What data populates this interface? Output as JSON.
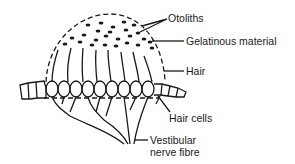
{
  "diagram": {
    "labels": {
      "otoliths": "Otoliths",
      "gelatinous": "Gelatinous material",
      "hair": "Hair",
      "hair_cells": "Hair cells",
      "nerve_line1": "Vestibular",
      "nerve_line2": "nerve fibre"
    },
    "colors": {
      "ink": "#1a1a1a",
      "background": "#ffffff"
    }
  }
}
